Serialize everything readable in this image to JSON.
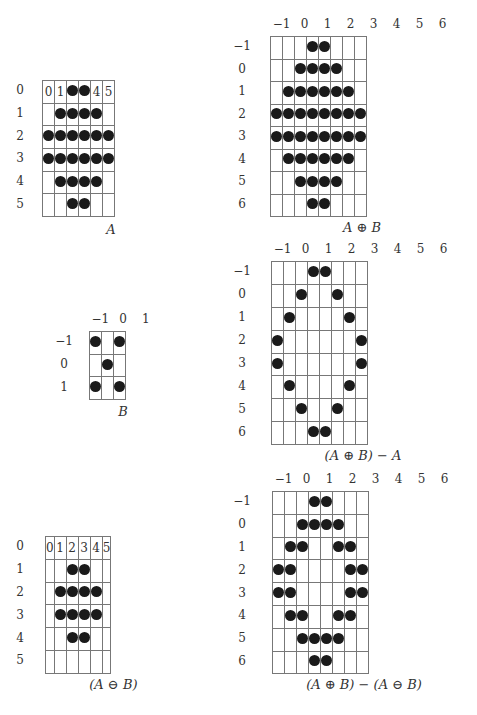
{
  "figures": [
    {
      "id": "A",
      "caption": "A",
      "x": 42,
      "y": 80,
      "cell_w": 23,
      "cell_h": 22.7,
      "col_labels": [],
      "row_labels": [
        "0",
        "1",
        "2",
        "3",
        "4",
        "5"
      ],
      "row_label_x": 14,
      "cols": [
        0,
        1,
        2,
        3,
        4,
        5
      ],
      "rows": [
        0,
        1,
        2,
        3,
        4,
        5
      ],
      "in_cell_labels": {
        "0,0": "0",
        "0,1": "1",
        "0,4": "4",
        "0,5": "5"
      },
      "filled": [
        [
          0,
          2
        ],
        [
          0,
          3
        ],
        [
          1,
          1
        ],
        [
          1,
          2
        ],
        [
          1,
          3
        ],
        [
          1,
          4
        ],
        [
          2,
          0
        ],
        [
          2,
          1
        ],
        [
          2,
          2
        ],
        [
          2,
          3
        ],
        [
          2,
          4
        ],
        [
          2,
          5
        ],
        [
          3,
          0
        ],
        [
          3,
          1
        ],
        [
          3,
          2
        ],
        [
          3,
          3
        ],
        [
          3,
          4
        ],
        [
          3,
          5
        ],
        [
          4,
          1
        ],
        [
          4,
          2
        ],
        [
          4,
          3
        ],
        [
          4,
          4
        ],
        [
          5,
          2
        ],
        [
          5,
          3
        ]
      ],
      "caption_y": 222
    },
    {
      "id": "A_dilate_B",
      "caption": "A ⊕ B",
      "x": 270,
      "y": 36,
      "cell_w": 23,
      "cell_h": 22.5,
      "col_labels": [
        "−1",
        "0",
        "1",
        "2",
        "3",
        "4",
        "5",
        "6"
      ],
      "row_labels": [
        "−1",
        "0",
        "1",
        "2",
        "3",
        "4",
        "5",
        "6"
      ],
      "row_label_x": 236,
      "cols": [
        -1,
        0,
        1,
        2,
        3,
        4,
        5,
        6
      ],
      "rows": [
        -1,
        0,
        1,
        2,
        3,
        4,
        5,
        6
      ],
      "in_cell_labels": {},
      "filled": [
        [
          -1,
          2
        ],
        [
          -1,
          3
        ],
        [
          0,
          1
        ],
        [
          0,
          2
        ],
        [
          0,
          3
        ],
        [
          0,
          4
        ],
        [
          1,
          0
        ],
        [
          1,
          1
        ],
        [
          1,
          2
        ],
        [
          1,
          3
        ],
        [
          1,
          4
        ],
        [
          1,
          5
        ],
        [
          2,
          -1
        ],
        [
          2,
          0
        ],
        [
          2,
          1
        ],
        [
          2,
          2
        ],
        [
          2,
          3
        ],
        [
          2,
          4
        ],
        [
          2,
          5
        ],
        [
          2,
          6
        ],
        [
          3,
          -1
        ],
        [
          3,
          0
        ],
        [
          3,
          1
        ],
        [
          3,
          2
        ],
        [
          3,
          3
        ],
        [
          3,
          4
        ],
        [
          3,
          5
        ],
        [
          3,
          6
        ],
        [
          4,
          0
        ],
        [
          4,
          1
        ],
        [
          4,
          2
        ],
        [
          4,
          3
        ],
        [
          4,
          4
        ],
        [
          4,
          5
        ],
        [
          5,
          1
        ],
        [
          5,
          2
        ],
        [
          5,
          3
        ],
        [
          5,
          4
        ],
        [
          6,
          2
        ],
        [
          6,
          3
        ]
      ],
      "caption_y": 220
    },
    {
      "id": "B",
      "caption": "B",
      "x": 89,
      "y": 331,
      "cell_w": 22.7,
      "cell_h": 22.7,
      "col_labels": [
        "−1",
        "0",
        "1"
      ],
      "row_labels": [
        "−1",
        "0",
        "1"
      ],
      "row_label_x": 58,
      "cols": [
        -1,
        0,
        1
      ],
      "rows": [
        -1,
        0,
        1
      ],
      "in_cell_labels": {},
      "filled": [
        [
          -1,
          -1
        ],
        [
          -1,
          1
        ],
        [
          0,
          0
        ],
        [
          1,
          -1
        ],
        [
          1,
          1
        ]
      ],
      "caption_y": 404
    },
    {
      "id": "A_dilate_B_minus_A",
      "caption": "(A ⊕ B) − A",
      "x": 271,
      "y": 261,
      "cell_w": 23,
      "cell_h": 22.9,
      "col_labels": [
        "−1",
        "0",
        "1",
        "2",
        "3",
        "4",
        "5",
        "6"
      ],
      "row_labels": [
        "−1",
        "0",
        "1",
        "2",
        "3",
        "4",
        "5",
        "6"
      ],
      "row_label_x": 236,
      "cols": [
        -1,
        0,
        1,
        2,
        3,
        4,
        5,
        6
      ],
      "rows": [
        -1,
        0,
        1,
        2,
        3,
        4,
        5,
        6
      ],
      "in_cell_labels": {},
      "filled": [
        [
          -1,
          2
        ],
        [
          -1,
          3
        ],
        [
          0,
          1
        ],
        [
          0,
          4
        ],
        [
          1,
          0
        ],
        [
          1,
          5
        ],
        [
          2,
          -1
        ],
        [
          2,
          6
        ],
        [
          3,
          -1
        ],
        [
          3,
          6
        ],
        [
          4,
          0
        ],
        [
          4,
          5
        ],
        [
          5,
          1
        ],
        [
          5,
          4
        ],
        [
          6,
          2
        ],
        [
          6,
          3
        ]
      ],
      "caption_y": 448
    },
    {
      "id": "A_erode_B",
      "caption": "(A ⊖ B)",
      "x": 45,
      "y": 536,
      "cell_w": 22.8,
      "cell_h": 22.8,
      "col_labels": [],
      "row_labels": [
        "0",
        "1",
        "2",
        "3",
        "4",
        "5"
      ],
      "row_label_x": 14,
      "cols": [
        0,
        1,
        2,
        3,
        4,
        5
      ],
      "rows": [
        0,
        1,
        2,
        3,
        4,
        5
      ],
      "in_cell_labels": {
        "0,0": "0",
        "0,1": "1",
        "0,2": "2",
        "0,3": "3",
        "0,4": "4",
        "0,5": "5"
      },
      "filled": [
        [
          1,
          2
        ],
        [
          1,
          3
        ],
        [
          2,
          1
        ],
        [
          2,
          2
        ],
        [
          2,
          3
        ],
        [
          2,
          4
        ],
        [
          3,
          1
        ],
        [
          3,
          2
        ],
        [
          3,
          3
        ],
        [
          3,
          4
        ],
        [
          4,
          2
        ],
        [
          4,
          3
        ]
      ],
      "caption_y": 677
    },
    {
      "id": "A_dilate_B_minus_A_erode_B",
      "caption": "(A ⊕ B) − (A ⊖ B)",
      "x": 272,
      "y": 491,
      "cell_w": 23,
      "cell_h": 22.8,
      "col_labels": [
        "−1",
        "0",
        "1",
        "2",
        "3",
        "4",
        "5",
        "6"
      ],
      "row_labels": [
        "−1",
        "0",
        "1",
        "2",
        "3",
        "4",
        "5",
        "6"
      ],
      "row_label_x": 236,
      "cols": [
        -1,
        0,
        1,
        2,
        3,
        4,
        5,
        6
      ],
      "rows": [
        -1,
        0,
        1,
        2,
        3,
        4,
        5,
        6
      ],
      "in_cell_labels": {},
      "filled": [
        [
          -1,
          2
        ],
        [
          -1,
          3
        ],
        [
          0,
          1
        ],
        [
          0,
          2
        ],
        [
          0,
          3
        ],
        [
          0,
          4
        ],
        [
          1,
          0
        ],
        [
          1,
          1
        ],
        [
          1,
          4
        ],
        [
          1,
          5
        ],
        [
          2,
          -1
        ],
        [
          2,
          0
        ],
        [
          2,
          5
        ],
        [
          2,
          6
        ],
        [
          3,
          -1
        ],
        [
          3,
          0
        ],
        [
          3,
          5
        ],
        [
          3,
          6
        ],
        [
          4,
          0
        ],
        [
          4,
          1
        ],
        [
          4,
          4
        ],
        [
          4,
          5
        ],
        [
          5,
          1
        ],
        [
          5,
          2
        ],
        [
          5,
          3
        ],
        [
          5,
          4
        ],
        [
          6,
          2
        ],
        [
          6,
          3
        ]
      ],
      "caption_y": 677
    }
  ]
}
